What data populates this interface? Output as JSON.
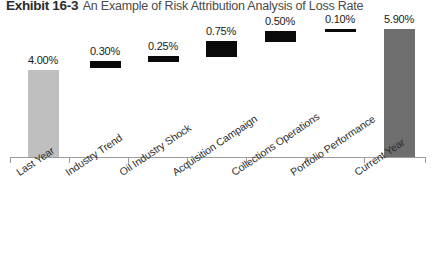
{
  "title": {
    "exhibit": "Exhibit 16-3",
    "text": "An Example of Risk Attribution Analysis of Loss Rate"
  },
  "colors": {
    "start_bar": "#bfbfbf",
    "end_bar": "#6e6e6e",
    "delta_bar": "#0a0a0a",
    "axis": "#9a9a9a",
    "label_text": "#1a1a1a"
  },
  "chart_data": {
    "type": "bar",
    "chart_style": "waterfall",
    "title": "Exhibit 16-3 An Example of Risk Attribution Analysis of Loss Rate",
    "xlabel": "",
    "ylabel": "",
    "ylim": [
      0,
      6.6
    ],
    "grid": false,
    "legend": "none",
    "categories": [
      "Last Year",
      "Industry Trend",
      "Oil Industry Shock",
      "Acquisition Campaign",
      "Collections Operations",
      "Portfolio Performance",
      "Current Year"
    ],
    "values": [
      4.0,
      0.3,
      0.25,
      0.75,
      0.5,
      0.1,
      5.9
    ],
    "data_labels": [
      "4.00%",
      "0.30%",
      "0.25%",
      "0.75%",
      "0.50%",
      "0.10%",
      "5.90%"
    ],
    "kinds": [
      "total",
      "delta",
      "delta",
      "delta",
      "delta",
      "delta",
      "total"
    ],
    "bar_base": [
      0.0,
      4.0,
      4.3,
      4.55,
      5.3,
      5.8,
      0.0
    ],
    "bar_top": [
      4.0,
      4.3,
      4.55,
      5.3,
      5.8,
      5.9,
      5.9
    ],
    "cumulative": [
      4.0,
      4.3,
      4.55,
      5.3,
      5.8,
      5.9,
      5.9
    ]
  },
  "bars": [
    {
      "label": "4.00%",
      "cat": "Last Year",
      "kind": "total-start",
      "x": 28,
      "w": 31,
      "top": 70,
      "h": 87
    },
    {
      "label": "0.30%",
      "cat": "Industry Trend",
      "kind": "delta",
      "x": 90,
      "w": 31,
      "top": 61,
      "h": 7
    },
    {
      "label": "0.25%",
      "cat": "Oil Industry Shock",
      "kind": "delta",
      "x": 148,
      "w": 31,
      "top": 56,
      "h": 6
    },
    {
      "label": "0.75%",
      "cat": "Acquisition Campaign",
      "kind": "delta",
      "x": 206,
      "w": 31,
      "top": 41,
      "h": 16
    },
    {
      "label": "0.50%",
      "cat": "Collections Operations",
      "kind": "delta",
      "x": 265,
      "w": 31,
      "top": 31,
      "h": 11
    },
    {
      "label": "0.10%",
      "cat": "Portfolio Performance",
      "kind": "delta",
      "x": 325,
      "w": 31,
      "top": 29,
      "h": 3
    },
    {
      "label": "5.90%",
      "cat": "Current Year",
      "kind": "total-end",
      "x": 384,
      "w": 31,
      "top": 29,
      "h": 128
    }
  ],
  "value_labels": [
    {
      "text": "4.00%",
      "x": 17,
      "y": 54
    },
    {
      "text": "0.30%",
      "x": 79,
      "y": 45
    },
    {
      "text": "0.25%",
      "x": 137,
      "y": 40
    },
    {
      "text": "0.75%",
      "x": 195,
      "y": 25
    },
    {
      "text": "0.50%",
      "x": 254,
      "y": 15
    },
    {
      "text": "0.10%",
      "x": 314,
      "y": 13
    },
    {
      "text": "5.90%",
      "x": 373,
      "y": 13
    }
  ],
  "category_labels": [
    {
      "text": "Last Year",
      "x": 14,
      "y": 168
    },
    {
      "text": "Industry Trend",
      "x": 63,
      "y": 168
    },
    {
      "text": "Oil Industry Shock",
      "x": 117,
      "y": 168
    },
    {
      "text": "Acquisition Campaign",
      "x": 170,
      "y": 168
    },
    {
      "text": "Collections Operations",
      "x": 229,
      "y": 168
    },
    {
      "text": "Portfolio Performance",
      "x": 288,
      "y": 168
    },
    {
      "text": "Current Year",
      "x": 352,
      "y": 168
    }
  ],
  "ticks": [
    10,
    69,
    128,
    187,
    246,
    305,
    364,
    425
  ]
}
